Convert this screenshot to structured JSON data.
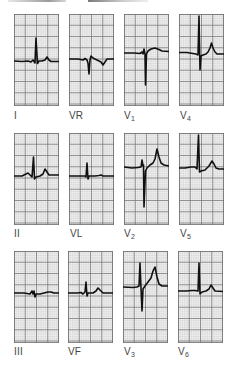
{
  "figure": {
    "type": "12-lead ECG",
    "layout": "3 rows x 4 columns",
    "grid": {
      "major_px": 11.25,
      "minor_per_major": 5,
      "bg": "#f1f1f1",
      "minor_line": "#c9c9c9",
      "major_line": "#6f6f6f"
    },
    "trace_color": "#111111"
  },
  "leads": [
    {
      "id": "I",
      "label": "I",
      "sub": "",
      "row": 0,
      "col": 0,
      "x": 14,
      "y": 14,
      "path": "M0,47 L8,47.5 L14,47 L17,48 L19,46 L21,49 L22,24 L23.5,49.5 L25,47 L28,47 L31,46 L33,43 L35,46 L37,47.5 L45,47.5"
    },
    {
      "id": "VR",
      "label": "VR",
      "sub": "",
      "row": 0,
      "col": 1,
      "x": 69,
      "y": 14,
      "path": "M0,45 L9,45 L14,46 L16,44.5 L18,46 L19,49 L20,60 L21,46 L22,42 L24,44 L28,46 L32,48 L34,51 L36,48 L38,45 L45,45"
    },
    {
      "id": "V1",
      "label": "V",
      "sub": "1",
      "row": 0,
      "col": 2,
      "x": 124,
      "y": 14,
      "path": "M0,39 L10,39 L16,39.5 L18,38 L19,40 L20,35 L21,40 L21.5,71 L22.5,40 L24,37 L27,35 L31,34 L35,35.5 L38,37 L45,37.5"
    },
    {
      "id": "V4",
      "label": "V",
      "sub": "4",
      "row": 0,
      "col": 3,
      "x": 179,
      "y": 14,
      "path": "M0,38.5 L8,38.5 L14,39.5 L17,40 L19,41 L20,2 L21,56 L22,42 L24,41 L27,40 L29,38 L31,34 L32.5,29 L34,34 L36,38 L38,40 L45,40"
    },
    {
      "id": "II",
      "label": "II",
      "sub": "",
      "row": 1,
      "col": 0,
      "x": 14,
      "y": 133,
      "path": "M0,43 L8,43 L12,41 L14,40 L16,42 L18,44 L19.5,24 L20.5,46 L22,44 L26,43 L29,41 L31,36 L33,39 L35,42 L37,42 L45,42"
    },
    {
      "id": "VL",
      "label": "VL",
      "sub": "",
      "row": 1,
      "col": 1,
      "x": 69,
      "y": 133,
      "path": "M0,43 L10,43 L16,43 L17,44 L18,30 L19,46 L20,43 L26,43 L30,42.5 L32,42 L34,43 L45,43"
    },
    {
      "id": "V2",
      "label": "V",
      "sub": "2",
      "row": 1,
      "col": 2,
      "x": 124,
      "y": 133,
      "path": "M0,34 L8,35 L14,34.5 L17,34 L18,27 L19,33 L19.5,32 L20,74 L21.5,38 L23,35 L26,32 L29,30 L31,26 L33,16 L35,24 L37,30 L40,32 L45,33"
    },
    {
      "id": "V5",
      "label": "V",
      "sub": "5",
      "row": 1,
      "col": 3,
      "x": 179,
      "y": 133,
      "path": "M0,35 L6,35 L12,34 L16,34 L18,36 L19.5,2 L20.5,39 L22,38 L26,37 L30,33 L33,28 L35,31 L37,35 L40,36 L45,36"
    },
    {
      "id": "III",
      "label": "III",
      "sub": "",
      "row": 2,
      "col": 0,
      "x": 14,
      "y": 251,
      "path": "M0,42 L10,42 L16,43 L18,40 L19,43 L20,40 L21,46 L22,43 L26,43 L30,42 L34,41 L37,41 L40,42 L45,42"
    },
    {
      "id": "VF",
      "label": "VF",
      "sub": "",
      "row": 2,
      "col": 1,
      "x": 68,
      "y": 251,
      "path": "M0,42 L9,42 L13,41.5 L15,43 L17,41 L18,31 L19,45 L20,42 L25,42 L28,40 L30,37 L32,39 L35,42 L45,42"
    },
    {
      "id": "V3",
      "label": "V",
      "sub": "3",
      "row": 2,
      "col": 2,
      "x": 123,
      "y": 251,
      "path": "M0,36 L10,36.5 L14,36 L16,35 L17,12 L18,37 L19,60 L20,38 L22,35 L25,31 L28,27 L30,20 L32,16 L34,26 L36,33 L39,35 L45,35"
    },
    {
      "id": "V6",
      "label": "V",
      "sub": "6",
      "row": 2,
      "col": 3,
      "x": 178,
      "y": 251,
      "path": "M0,40 L8,40 L14,39.5 L17,39.5 L20,40 L21,12 L22,43 L24,41 L28,40 L31,38 L33,34 L35,37 L37,40 L45,40.5"
    }
  ],
  "labels": [
    {
      "text": "I",
      "sub": "",
      "x": 14,
      "y": 111
    },
    {
      "text": "VR",
      "sub": "",
      "x": 69,
      "y": 111
    },
    {
      "text": "V",
      "sub": "1",
      "x": 124,
      "y": 111
    },
    {
      "text": "V",
      "sub": "4",
      "x": 180,
      "y": 111
    },
    {
      "text": "II",
      "sub": "",
      "x": 14,
      "y": 229
    },
    {
      "text": "VL",
      "sub": "",
      "x": 70,
      "y": 229
    },
    {
      "text": "V",
      "sub": "2",
      "x": 124,
      "y": 229
    },
    {
      "text": "V",
      "sub": "5",
      "x": 180,
      "y": 229
    },
    {
      "text": "III",
      "sub": "",
      "x": 14,
      "y": 347
    },
    {
      "text": "VF",
      "sub": "",
      "x": 68,
      "y": 347
    },
    {
      "text": "V",
      "sub": "3",
      "x": 124,
      "y": 347
    },
    {
      "text": "V",
      "sub": "6",
      "x": 178,
      "y": 347
    }
  ]
}
